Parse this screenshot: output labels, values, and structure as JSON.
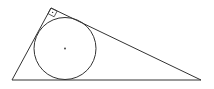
{
  "diagram": {
    "stroke_color": "#333333",
    "background_color": "#ffffff",
    "elements": [
      {
        "name": "triangle",
        "description": "right triangle, right angle at top vertex"
      },
      {
        "name": "incircle",
        "description": "inscribed circle tangent to all three sides"
      },
      {
        "name": "incenter",
        "description": "center point of inscribed circle"
      },
      {
        "name": "right-angle-marker",
        "description": "small square with dot at right-angle vertex"
      }
    ]
  }
}
